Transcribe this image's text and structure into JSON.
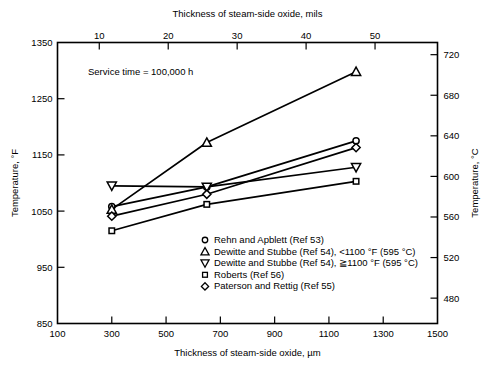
{
  "chart_data": {
    "type": "line",
    "title": "",
    "annotation": "Service time = 100,000 h",
    "xlabel": "Thickness of steam-side oxide, µm",
    "xlabel_top": "Thickness of steam-side oxide, mils",
    "ylabel": "Temperature, °F",
    "ylabel_right": "Temperature, °C",
    "xlim": [
      100,
      1500
    ],
    "ylim": [
      850,
      1350
    ],
    "ylim_right": [
      455,
      732
    ],
    "xlim_top": [
      3.94,
      59.06
    ],
    "xticks": [
      100,
      300,
      500,
      700,
      900,
      1100,
      1300,
      1500
    ],
    "xticks_top": [
      10,
      20,
      30,
      40,
      50
    ],
    "yticks": [
      850,
      950,
      1050,
      1150,
      1250,
      1350
    ],
    "yticks_right": [
      480,
      520,
      560,
      600,
      640,
      680,
      720
    ],
    "grid": false,
    "legend_position": "lower-center-right",
    "series": [
      {
        "name": "Rehn and Apblett (Ref 53)",
        "marker": "circle",
        "points": [
          [
            300,
            1058
          ],
          [
            650,
            1093
          ],
          [
            1200,
            1175
          ]
        ]
      },
      {
        "name": "Dewitte and Stubbe (Ref 54), <1100 °F (595 °C)",
        "marker": "triangle-up",
        "points": [
          [
            300,
            1053
          ],
          [
            650,
            1172
          ],
          [
            1200,
            1298
          ]
        ]
      },
      {
        "name": "Dewitte and Stubbe (Ref 54), ≧1100 °F (595 °C)",
        "marker": "triangle-down",
        "points": [
          [
            300,
            1095
          ],
          [
            650,
            1093
          ],
          [
            1200,
            1128
          ]
        ]
      },
      {
        "name": "Roberts (Ref 56)",
        "marker": "square",
        "points": [
          [
            300,
            1015
          ],
          [
            650,
            1062
          ],
          [
            1200,
            1103
          ]
        ]
      },
      {
        "name": "Paterson and Rettig (Ref 55)",
        "marker": "diamond",
        "points": [
          [
            300,
            1041
          ],
          [
            650,
            1080
          ],
          [
            1200,
            1163
          ]
        ]
      }
    ],
    "legend": [
      {
        "marker": "circle",
        "label": "Rehn and Apblett (Ref 53)"
      },
      {
        "marker": "triangle-up",
        "label": "Dewitte and Stubbe (Ref 54), <1100 °F (595 °C)"
      },
      {
        "marker": "triangle-down",
        "label": "Dewitte and Stubbe (Ref 54), ≧1100 °F (595 °C)"
      },
      {
        "marker": "square",
        "label": "Roberts (Ref 56)"
      },
      {
        "marker": "diamond",
        "label": "Paterson and Rettig (Ref 55)"
      }
    ],
    "colors": {
      "line": "#000000",
      "marker_fill": "#ffffff",
      "background": "#ffffff"
    }
  }
}
